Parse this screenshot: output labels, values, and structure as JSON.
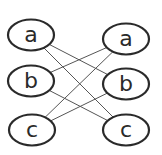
{
  "diagram": {
    "type": "bipartite-graph",
    "left_nodes": [
      {
        "id": "La",
        "label": "a"
      },
      {
        "id": "Lb",
        "label": "b"
      },
      {
        "id": "Lc",
        "label": "c"
      }
    ],
    "right_nodes": [
      {
        "id": "Ra",
        "label": "a"
      },
      {
        "id": "Rb",
        "label": "b"
      },
      {
        "id": "Rc",
        "label": "c"
      }
    ],
    "edges": [
      {
        "from": "La",
        "to": "Rb"
      },
      {
        "from": "La",
        "to": "Rc"
      },
      {
        "from": "Lb",
        "to": "Ra"
      },
      {
        "from": "Lb",
        "to": "Rc"
      },
      {
        "from": "Lc",
        "to": "Ra"
      },
      {
        "from": "Lc",
        "to": "Rb"
      }
    ]
  }
}
